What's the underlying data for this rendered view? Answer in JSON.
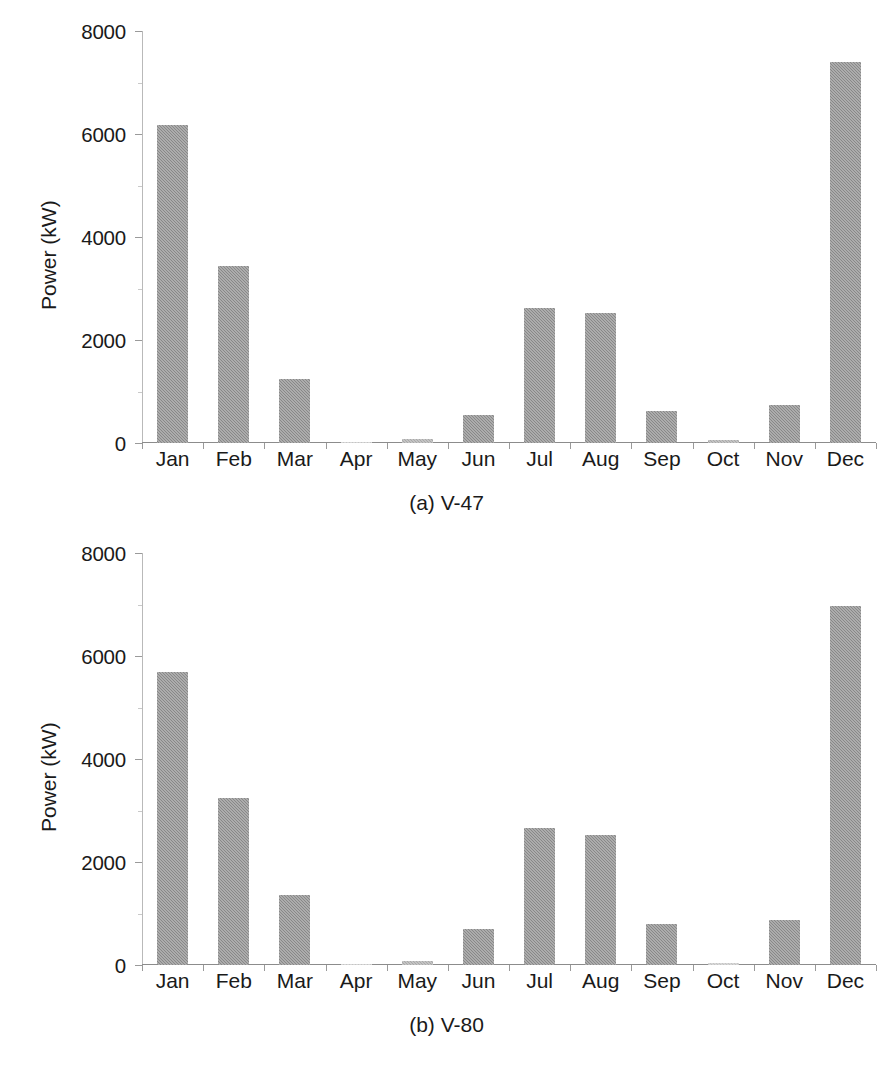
{
  "chart_data": [
    {
      "type": "bar",
      "id": "v47",
      "title": "(a) V-47",
      "caption": "(a) V-47",
      "xlabel": "",
      "ylabel": "Power (kW)",
      "ylim": [
        0,
        8000
      ],
      "grid": false,
      "legend": null,
      "ytick_labels": [
        "8000",
        "6000",
        "4000",
        "2000",
        "0"
      ],
      "ytick_values": [
        8000,
        6000,
        4000,
        2000,
        0
      ],
      "categories": [
        "Jan",
        "Feb",
        "Mar",
        "Apr",
        "May",
        "Jun",
        "Jul",
        "Aug",
        "Sep",
        "Oct",
        "Nov",
        "Dec"
      ],
      "values": [
        6175,
        3440,
        1250,
        15,
        75,
        540,
        2620,
        2520,
        630,
        60,
        730,
        7400
      ],
      "series_color": "#888888"
    },
    {
      "type": "bar",
      "id": "v80",
      "title": "(b) V-80",
      "caption": "(b) V-80",
      "xlabel": "",
      "ylabel": "Power (kW)",
      "ylim": [
        0,
        8000
      ],
      "grid": false,
      "legend": null,
      "ytick_labels": [
        "8000",
        "6000",
        "4000",
        "2000",
        "0"
      ],
      "ytick_values": [
        8000,
        6000,
        4000,
        2000,
        0
      ],
      "categories": [
        "Jan",
        "Feb",
        "Mar",
        "Apr",
        "May",
        "Jun",
        "Jul",
        "Aug",
        "Sep",
        "Oct",
        "Nov",
        "Dec"
      ],
      "values": [
        5690,
        3250,
        1360,
        25,
        80,
        690,
        2660,
        2530,
        790,
        45,
        880,
        6980
      ],
      "series_color": "#888888"
    }
  ],
  "panel_a": {
    "caption": "(a) V-47",
    "ylabel": "Power (kW)",
    "yticks": [
      "8000",
      "6000",
      "4000",
      "2000",
      "0"
    ],
    "months": [
      "Jan",
      "Feb",
      "Mar",
      "Apr",
      "May",
      "Jun",
      "Jul",
      "Aug",
      "Sep",
      "Oct",
      "Nov",
      "Dec"
    ]
  },
  "panel_b": {
    "caption": "(b) V-80",
    "ylabel": "Power (kW)",
    "yticks": [
      "8000",
      "6000",
      "4000",
      "2000",
      "0"
    ],
    "months": [
      "Jan",
      "Feb",
      "Mar",
      "Apr",
      "May",
      "Jun",
      "Jul",
      "Aug",
      "Sep",
      "Oct",
      "Nov",
      "Dec"
    ]
  },
  "colors": {
    "bar_fill": "#888888",
    "axis": "#8c8c8c",
    "text": "#1a1a1a",
    "background": "#ffffff"
  }
}
